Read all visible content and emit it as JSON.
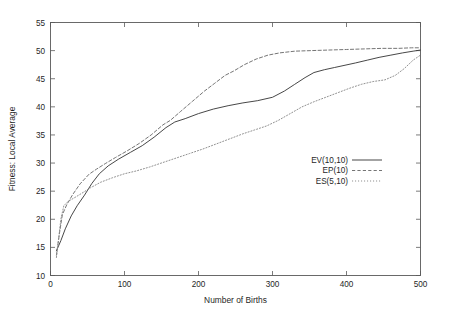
{
  "chart_data": {
    "type": "line",
    "title": "",
    "xlabel": "Number of Births",
    "ylabel": "Fitness: Local Average",
    "xlim": [
      0,
      500
    ],
    "ylim": [
      10,
      55
    ],
    "xticks": [
      0,
      100,
      200,
      300,
      400,
      500
    ],
    "yticks": [
      10,
      15,
      20,
      25,
      30,
      35,
      40,
      45,
      50,
      55
    ],
    "xtick_labels": [
      "0",
      "100",
      "200",
      "300",
      "400",
      "500"
    ],
    "ytick_labels": [
      "10",
      "15",
      "20",
      "25",
      "30",
      "35",
      "40",
      "45",
      "50",
      "55"
    ],
    "grid": false,
    "legend_position": "inside-right",
    "series": [
      {
        "name": "EV(10,10)",
        "style": "solid",
        "color": "#3d3d3d",
        "x": [
          8,
          14,
          20,
          28,
          36,
          46,
          56,
          66,
          78,
          92,
          108,
          124,
          140,
          156,
          168,
          182,
          200,
          220,
          240,
          260,
          280,
          300,
          316,
          330,
          344,
          356,
          370,
          384,
          398,
          412,
          428,
          444,
          460,
          476,
          490,
          500
        ],
        "y": [
          14.4,
          16.2,
          18.3,
          20.6,
          22.4,
          24.3,
          26.4,
          28.1,
          29.5,
          30.7,
          31.9,
          33.1,
          34.6,
          36.3,
          37.3,
          37.9,
          38.8,
          39.6,
          40.2,
          40.7,
          41.1,
          41.7,
          42.8,
          44.0,
          45.2,
          46.1,
          46.6,
          47.0,
          47.4,
          47.8,
          48.3,
          48.8,
          49.2,
          49.6,
          49.9,
          50.1
        ]
      },
      {
        "name": "EP(10)",
        "style": "dashed",
        "color": "#6e6e6e",
        "x": [
          8,
          12,
          16,
          22,
          30,
          40,
          52,
          62,
          74,
          88,
          104,
          120,
          136,
          152,
          162,
          176,
          192,
          208,
          222,
          236,
          248,
          262,
          278,
          294,
          310,
          330,
          352,
          376,
          400,
          424,
          448,
          470,
          488,
          500
        ],
        "y": [
          13.6,
          17.4,
          20.8,
          22.6,
          24.4,
          26.3,
          28.0,
          28.9,
          29.9,
          31.0,
          32.2,
          33.5,
          35.0,
          36.8,
          37.6,
          39.2,
          41.0,
          42.8,
          44.2,
          45.6,
          46.4,
          47.5,
          48.5,
          49.2,
          49.6,
          49.9,
          50.0,
          50.1,
          50.2,
          50.3,
          50.4,
          50.4,
          50.5,
          50.5
        ]
      },
      {
        "name": "ES(5,10)",
        "style": "dotted",
        "color": "#8a8a8a",
        "x": [
          8,
          11,
          14,
          18,
          24,
          32,
          42,
          54,
          68,
          84,
          100,
          116,
          134,
          152,
          170,
          188,
          206,
          224,
          242,
          260,
          276,
          292,
          308,
          324,
          340,
          356,
          372,
          388,
          404,
          420,
          436,
          452,
          466,
          478,
          490,
          500
        ],
        "y": [
          13.2,
          16.5,
          20.0,
          22.4,
          23.2,
          23.8,
          24.6,
          25.6,
          26.6,
          27.4,
          28.1,
          28.6,
          29.3,
          30.1,
          30.9,
          31.7,
          32.5,
          33.4,
          34.3,
          35.2,
          35.9,
          36.6,
          37.6,
          38.8,
          40.0,
          40.9,
          41.7,
          42.5,
          43.3,
          44.0,
          44.5,
          44.8,
          45.6,
          46.8,
          48.3,
          49.2
        ]
      }
    ]
  },
  "legend": {
    "entries": [
      {
        "label": "EV(10,10)"
      },
      {
        "label": "EP(10)"
      },
      {
        "label": "ES(5,10)"
      }
    ]
  }
}
